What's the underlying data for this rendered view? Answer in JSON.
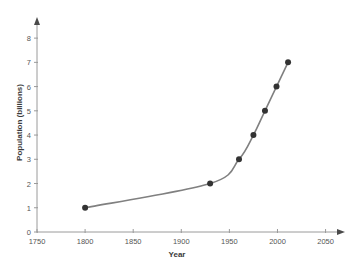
{
  "chart_data": {
    "type": "line",
    "title": "",
    "subtitle": "",
    "xlabel": "Year",
    "ylabel": "Population (billions)",
    "xlim": [
      1750,
      2065
    ],
    "ylim": [
      0,
      8.5
    ],
    "xticks": [
      1750,
      1800,
      1850,
      1900,
      1950,
      2000,
      2050
    ],
    "xtick_labels": [
      "1750",
      "1800",
      "1850",
      "1900",
      "1950",
      "2000",
      "2050"
    ],
    "yticks": [
      0,
      1,
      2,
      3,
      4,
      5,
      6,
      7,
      8
    ],
    "ytick_labels": [
      "0",
      "1",
      "2",
      "3",
      "4",
      "5",
      "6",
      "7",
      "8"
    ],
    "grid": false,
    "legend": false,
    "x": [
      1800,
      1930,
      1960,
      1975,
      1987,
      1999,
      2011
    ],
    "values": [
      1,
      2,
      3,
      4,
      5,
      6,
      7
    ],
    "series": [
      {
        "name": "World population",
        "x": [
          1800,
          1930,
          1960,
          1975,
          1987,
          1999,
          2011
        ],
        "values": [
          1,
          2,
          3,
          4,
          5,
          6,
          7
        ]
      }
    ],
    "points": [
      {
        "year": 1800,
        "population": 1
      },
      {
        "year": 1930,
        "population": 2
      },
      {
        "year": 1960,
        "population": 3
      },
      {
        "year": 1975,
        "population": 4
      },
      {
        "year": 1987,
        "population": 5
      },
      {
        "year": 1999,
        "population": 6
      },
      {
        "year": 2011,
        "population": 7
      }
    ],
    "colors": {
      "line": "#808080",
      "marker": "#333333",
      "axis": "#9a9a9a",
      "tick_text": "#555555",
      "label_text": "#3a3a3a",
      "background": "#ffffff"
    },
    "axis_arrows": {
      "x_end": true,
      "y_end": true
    }
  },
  "axes": {
    "x_title": "Year",
    "y_title": "Population (billions)"
  }
}
